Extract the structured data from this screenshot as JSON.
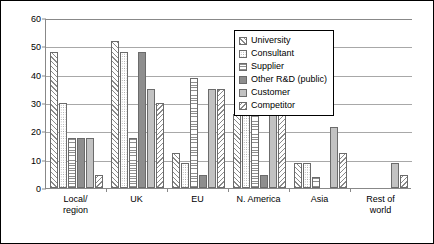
{
  "chart_data": {
    "type": "bar",
    "title": "",
    "subtitle": "",
    "xlabel": "",
    "ylabel": "",
    "ylim": [
      0,
      60
    ],
    "yticks": [
      0,
      10,
      20,
      30,
      40,
      50,
      60
    ],
    "grid": true,
    "legend_position": "upper-right-inside",
    "categories": [
      "Local/ region",
      "UK",
      "EU",
      "N. America",
      "Asia",
      "Rest of world"
    ],
    "category_lines": [
      [
        "Local/",
        "region"
      ],
      [
        "UK",
        ""
      ],
      [
        "EU",
        ""
      ],
      [
        "N. America",
        ""
      ],
      [
        "Asia",
        ""
      ],
      [
        "Rest of",
        "world"
      ]
    ],
    "series": [
      {
        "name": "University",
        "pattern": "diagonal-hatch-right",
        "values": [
          48,
          52,
          12.5,
          26,
          9,
          0
        ]
      },
      {
        "name": "Consultant",
        "pattern": "fine-dots",
        "values": [
          30,
          48,
          9,
          26,
          9,
          0
        ]
      },
      {
        "name": "Supplier",
        "pattern": "horizontal-lines",
        "values": [
          17.5,
          17.5,
          39,
          35,
          4,
          0
        ]
      },
      {
        "name": "Other R&D (public)",
        "pattern": "solid-dark-gray",
        "values": [
          17.5,
          48,
          4.5,
          4.5,
          0,
          0
        ]
      },
      {
        "name": "Customer",
        "pattern": "solid-light-gray",
        "values": [
          17.5,
          35,
          35,
          43.5,
          21.5,
          9
        ]
      },
      {
        "name": "Competitor",
        "pattern": "diagonal-hatch-left",
        "values": [
          4.5,
          30,
          35,
          26,
          12.5,
          4.5
        ]
      }
    ]
  },
  "legend": {
    "items": [
      {
        "label": "University"
      },
      {
        "label": "Consultant"
      },
      {
        "label": "Supplier"
      },
      {
        "label": "Other R&D (public)"
      },
      {
        "label": "Customer"
      },
      {
        "label": "Competitor"
      }
    ]
  },
  "colors": {
    "axis": "#888888",
    "gridline": "#a8a8a8",
    "bar_outline": "#6b6b6b",
    "other_rd_fill": "#8e8e8e",
    "customer_fill": "#c2c2c2",
    "frame": "#000000",
    "background": "#ffffff"
  }
}
